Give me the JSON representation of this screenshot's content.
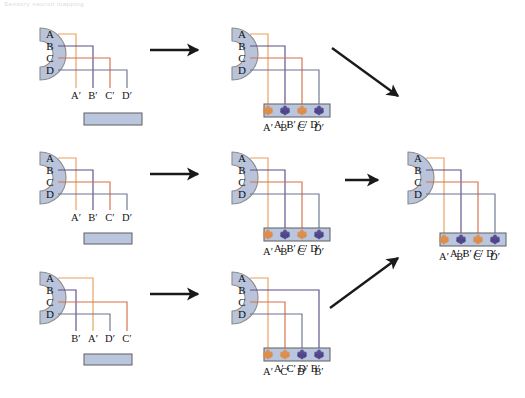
{
  "figure": {
    "top_caption": "Sensory neuron mapping",
    "background_color": "#ffffff"
  },
  "colors": {
    "receptor_fill": "#b9c4da",
    "receptor_edge": "#8c8c8c",
    "bar_fill": "#b9c6dd",
    "bar_edge": "#6b6b6b",
    "arrow": "#1a1a1a",
    "line_orange": "#e8a05c",
    "line_salmon": "#d4704a",
    "line_purple": "#5b4f8a",
    "line_slate": "#6c7590",
    "dot_orange": "#e08a43",
    "dot_purple": "#4c3f86",
    "label_text": "#111111"
  },
  "labels": {
    "source": [
      "A",
      "B",
      "C",
      "D"
    ],
    "A_prime": "A′",
    "B_prime": "B′",
    "C_prime": "C′",
    "D_prime": "D′"
  },
  "panels": [
    {
      "id": "panel-top-left",
      "name": "top-left-unmapped",
      "row": 1,
      "column": 1,
      "receptor_labels": [
        "A",
        "B",
        "C",
        "D"
      ],
      "target_labels": [
        "A′",
        "B′",
        "C′",
        "D′"
      ],
      "bar_has_dots": false,
      "bar_label": ""
    },
    {
      "id": "panel-top-middle",
      "name": "top-middle-mapped",
      "row": 1,
      "column": 2,
      "receptor_labels": [
        "A",
        "B",
        "C",
        "D"
      ],
      "target_labels": [
        "A′",
        "B′",
        "C′",
        "D′"
      ],
      "bar_has_dots": true,
      "bar_label": "A′ B′ C′ D′",
      "dot_colors": [
        "#e08a43",
        "#4c3f86",
        "#e08a43",
        "#4c3f86"
      ]
    },
    {
      "id": "panel-mid-left",
      "name": "middle-left-unmapped",
      "row": 2,
      "column": 1,
      "receptor_labels": [
        "A",
        "B",
        "C",
        "D"
      ],
      "target_labels": [
        "A′",
        "B′",
        "C′",
        "D′"
      ],
      "bar_has_dots": false,
      "bar_label": ""
    },
    {
      "id": "panel-mid-middle",
      "name": "middle-middle-mapped",
      "row": 2,
      "column": 2,
      "receptor_labels": [
        "A",
        "B",
        "C",
        "D"
      ],
      "target_labels": [
        "A′",
        "B′",
        "C′",
        "D′"
      ],
      "bar_has_dots": true,
      "bar_label": "A′ B′ C′ D′",
      "dot_colors": [
        "#e08a43",
        "#4c3f86",
        "#e08a43",
        "#4c3f86"
      ]
    },
    {
      "id": "panel-bottom-left",
      "name": "bottom-left-unmapped-scrambled",
      "row": 3,
      "column": 1,
      "receptor_labels": [
        "A",
        "B",
        "C",
        "D"
      ],
      "target_labels": [
        "B′",
        "A′",
        "D′",
        "C′"
      ],
      "bar_has_dots": false,
      "bar_label": ""
    },
    {
      "id": "panel-bottom-middle",
      "name": "bottom-middle-mapped-scrambled",
      "row": 3,
      "column": 2,
      "receptor_labels": [
        "A",
        "B",
        "C",
        "D"
      ],
      "target_labels": [
        "A′",
        "C′",
        "D′",
        "B′"
      ],
      "bar_has_dots": true,
      "bar_label": "A′ C′ D′ B′",
      "dot_colors": [
        "#e08a43",
        "#e08a43",
        "#4c3f86",
        "#4c3f86"
      ]
    },
    {
      "id": "panel-right",
      "name": "right-final-consensus",
      "row": 2,
      "column": 3,
      "receptor_labels": [
        "A",
        "B",
        "C",
        "D"
      ],
      "target_labels": [
        "A′",
        "B′",
        "C′",
        "D′"
      ],
      "bar_has_dots": true,
      "bar_label": "A′ B′ C′ D′",
      "dot_colors": [
        "#e08a43",
        "#4c3f86",
        "#e08a43",
        "#4c3f86"
      ]
    }
  ],
  "arrows": [
    {
      "id": "arrow-top-horizontal",
      "name": "arrow-row1-left-to-middle",
      "direction": "right"
    },
    {
      "id": "arrow-mid-horizontal",
      "name": "arrow-row2-left-to-middle",
      "direction": "right"
    },
    {
      "id": "arrow-bottom-horizontal",
      "name": "arrow-row3-left-to-middle",
      "direction": "right"
    },
    {
      "id": "arrow-top-diagonal",
      "name": "arrow-row1-to-final-down-right",
      "direction": "down-right"
    },
    {
      "id": "arrow-mid-horizontal-final",
      "name": "arrow-row2-to-final-right",
      "direction": "right"
    },
    {
      "id": "arrow-bottom-diagonal",
      "name": "arrow-row3-to-final-up-right",
      "direction": "up-right"
    }
  ]
}
